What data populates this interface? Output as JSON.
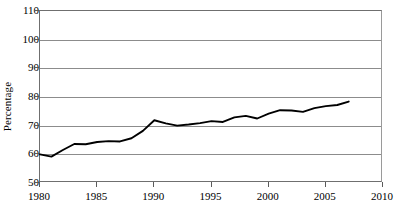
{
  "chart_data": {
    "type": "line",
    "title": "",
    "xlabel": "",
    "ylabel": "Percentage",
    "xlim": [
      1980,
      2010
    ],
    "ylim": [
      50,
      110
    ],
    "xticks": [
      1980,
      1985,
      1990,
      1995,
      2000,
      2005,
      2010
    ],
    "yticks": [
      50,
      60,
      70,
      80,
      90,
      100,
      110
    ],
    "grid": "horizontal",
    "legend": "none",
    "line_color": "#000000",
    "grid_color": "#8c8c8c",
    "x": [
      1980,
      1981,
      1982,
      1983,
      1984,
      1985,
      1986,
      1987,
      1988,
      1989,
      1990,
      1991,
      1992,
      1993,
      1994,
      1995,
      1996,
      1997,
      1998,
      1999,
      2000,
      2001,
      2002,
      2003,
      2004,
      2005,
      2006,
      2007
    ],
    "series": [
      {
        "name": "Percentage",
        "values": [
          60.0,
          59.2,
          61.5,
          63.6,
          63.5,
          64.3,
          64.6,
          64.5,
          65.6,
          68.2,
          71.9,
          70.8,
          70.0,
          70.4,
          70.9,
          71.6,
          71.3,
          72.9,
          73.4,
          72.5,
          74.2,
          75.4,
          75.3,
          74.8,
          76.1,
          76.8,
          77.2,
          78.4
        ]
      }
    ]
  }
}
